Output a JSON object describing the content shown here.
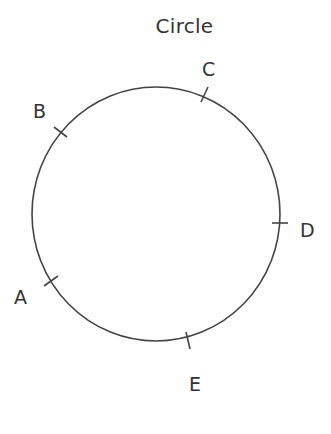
{
  "diagram": {
    "title": "Circle",
    "circle": {
      "cx": 156,
      "cy": 214,
      "rx": 124,
      "ry": 127,
      "stroke": "#444444",
      "stroke_width": 1.6
    },
    "points": [
      {
        "label": "A",
        "tick": {
          "x1": 44,
          "y1": 286,
          "x2": 58,
          "y2": 276
        },
        "label_pos": {
          "x": 14,
          "y": 288
        }
      },
      {
        "label": "B",
        "tick": {
          "x1": 54,
          "y1": 127,
          "x2": 67,
          "y2": 137
        },
        "label_pos": {
          "x": 33,
          "y": 102
        }
      },
      {
        "label": "C",
        "tick": {
          "x1": 201,
          "y1": 102,
          "x2": 208,
          "y2": 87
        },
        "label_pos": {
          "x": 202,
          "y": 60
        }
      },
      {
        "label": "D",
        "tick": {
          "x1": 272,
          "y1": 223,
          "x2": 288,
          "y2": 223
        },
        "label_pos": {
          "x": 300,
          "y": 221
        }
      },
      {
        "label": "E",
        "tick": {
          "x1": 186,
          "y1": 332,
          "x2": 190,
          "y2": 349
        },
        "label_pos": {
          "x": 189,
          "y": 375
        }
      }
    ]
  }
}
